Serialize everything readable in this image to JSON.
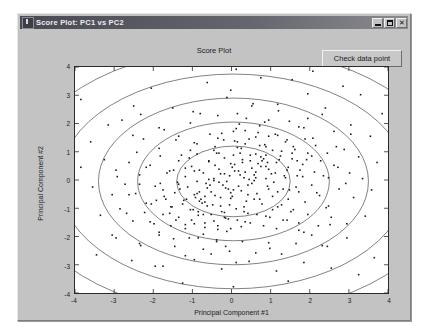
{
  "window": {
    "title": "Score Plot: PC1  vs  PC2",
    "app_icon": "matlab-figure-icon",
    "controls": {
      "minimize": "minimize-icon",
      "maximize": "maximize-icon",
      "close": "✕"
    }
  },
  "toolbar": {
    "check_data_point_label": "Check data point"
  },
  "colors": {
    "window_face": "#c3c3c3",
    "titlebar": "#66666e",
    "plot_background": "#ffffff",
    "axis_line": "#2b2b2b",
    "marker": "#1a1a1a",
    "contour": "#4a4a4a"
  },
  "chart_data": {
    "type": "scatter",
    "title": "Score Plot",
    "xlabel": "Principal Component  #1",
    "ylabel": "Principal Component  #2",
    "xlim": [
      -4,
      4
    ],
    "ylim": [
      -4,
      4
    ],
    "xticks": [
      -4,
      -3,
      -2,
      -1,
      0,
      1,
      2,
      3,
      4
    ],
    "yticks": [
      -4,
      -3,
      -2,
      -1,
      0,
      1,
      2,
      3,
      4
    ],
    "xtick_labels": [
      "-4",
      "-3",
      "-2",
      "-1",
      "0",
      "1",
      "2",
      "3",
      "4"
    ],
    "ytick_labels": [
      "-4",
      "-3",
      "-2",
      "-1",
      "0",
      "1",
      "2",
      "3",
      "4"
    ],
    "grid": false,
    "legend": null,
    "marker_style": "dot",
    "marker_size_px": 1.6,
    "n_points": 430,
    "distribution": {
      "kind": "bivariate-normal",
      "mean": [
        0.05,
        -0.05
      ],
      "sigma_x": 1.05,
      "sigma_y": 0.95,
      "correlation": 0.05
    },
    "contours": {
      "description": "concentric confidence ellipses centred on the data mean",
      "center": [
        0.05,
        -0.05
      ],
      "orientation_deg": 0,
      "radii": [
        {
          "rx": 1.45,
          "ry": 1.25
        },
        {
          "rx": 2.45,
          "ry": 2.1
        },
        {
          "rx": 3.45,
          "ry": 2.95
        },
        {
          "rx": 4.45,
          "ry": 3.8
        },
        {
          "rx": 5.5,
          "ry": 4.7
        }
      ]
    },
    "points": [
      [
        0.12,
        3.92
      ],
      [
        1.55,
        3.55
      ],
      [
        -0.02,
        3.18
      ],
      [
        2.85,
        3.32
      ],
      [
        3.3,
        3.02
      ],
      [
        -2.5,
        2.62
      ],
      [
        -1.5,
        2.55
      ],
      [
        -0.8,
        2.35
      ],
      [
        0.55,
        2.7
      ],
      [
        1.2,
        2.45
      ],
      [
        1.95,
        2.18
      ],
      [
        2.4,
        2.55
      ],
      [
        -3.15,
        1.95
      ],
      [
        -2.8,
        2.12
      ],
      [
        -1.05,
        2.02
      ],
      [
        -0.35,
        2.28
      ],
      [
        0.2,
        1.98
      ],
      [
        0.95,
        2.12
      ],
      [
        1.72,
        1.88
      ],
      [
        2.62,
        1.72
      ],
      [
        3.05,
        1.62
      ],
      [
        3.55,
        1.55
      ],
      [
        -3.6,
        1.35
      ],
      [
        -2.25,
        1.45
      ],
      [
        -1.85,
        1.12
      ],
      [
        -1.35,
        1.55
      ],
      [
        -0.95,
        1.32
      ],
      [
        -0.55,
        1.62
      ],
      [
        -0.2,
        1.42
      ],
      [
        0.05,
        1.72
      ],
      [
        0.35,
        1.28
      ],
      [
        0.62,
        1.52
      ],
      [
        0.88,
        1.18
      ],
      [
        1.12,
        1.62
      ],
      [
        1.38,
        1.35
      ],
      [
        1.62,
        1.08
      ],
      [
        1.88,
        1.45
      ],
      [
        2.15,
        1.22
      ],
      [
        2.45,
        0.95
      ],
      [
        2.88,
        1.08
      ],
      [
        3.25,
        0.82
      ],
      [
        3.72,
        0.62
      ],
      [
        -3.85,
        0.45
      ],
      [
        -3.25,
        0.72
      ],
      [
        -2.95,
        0.35
      ],
      [
        -2.62,
        0.62
      ],
      [
        -2.35,
        0.18
      ],
      [
        -2.08,
        0.52
      ],
      [
        -1.82,
        0.85
      ],
      [
        -1.58,
        0.32
      ],
      [
        -1.35,
        0.68
      ],
      [
        -1.18,
        0.12
      ],
      [
        -1.02,
        0.48
      ],
      [
        -0.88,
        0.92
      ],
      [
        -0.72,
        0.25
      ],
      [
        -0.58,
        0.65
      ],
      [
        -0.45,
        1.05
      ],
      [
        -0.32,
        0.38
      ],
      [
        -0.18,
        0.78
      ],
      [
        -0.05,
        0.15
      ],
      [
        0.08,
        0.55
      ],
      [
        0.22,
        0.95
      ],
      [
        0.35,
        0.28
      ],
      [
        0.48,
        0.68
      ],
      [
        0.62,
        0.08
      ],
      [
        0.75,
        0.48
      ],
      [
        0.88,
        0.88
      ],
      [
        1.02,
        0.22
      ],
      [
        1.15,
        0.62
      ],
      [
        1.28,
        1.02
      ],
      [
        1.42,
        0.35
      ],
      [
        1.55,
        0.75
      ],
      [
        1.68,
        0.15
      ],
      [
        1.82,
        0.55
      ],
      [
        1.95,
        0.95
      ],
      [
        2.12,
        0.28
      ],
      [
        2.28,
        0.68
      ],
      [
        2.48,
        0.08
      ],
      [
        2.72,
        0.45
      ],
      [
        3.02,
        0.25
      ],
      [
        3.35,
        0.05
      ],
      [
        -3.55,
        -0.25
      ],
      [
        -3.05,
        -0.52
      ],
      [
        -2.72,
        -0.15
      ],
      [
        -2.45,
        -0.48
      ],
      [
        -2.18,
        -0.82
      ],
      [
        -1.95,
        -0.22
      ],
      [
        -1.72,
        -0.58
      ],
      [
        -1.52,
        -0.95
      ],
      [
        -1.32,
        -0.32
      ],
      [
        -1.15,
        -0.68
      ],
      [
        -0.98,
        -1.05
      ],
      [
        -0.82,
        -0.42
      ],
      [
        -0.68,
        -0.78
      ],
      [
        -0.55,
        -0.18
      ],
      [
        -0.42,
        -0.55
      ],
      [
        -0.28,
        -0.92
      ],
      [
        -0.15,
        -0.28
      ],
      [
        -0.02,
        -0.65
      ],
      [
        0.12,
        -1.02
      ],
      [
        0.25,
        -0.38
      ],
      [
        0.38,
        -0.75
      ],
      [
        0.52,
        -0.12
      ],
      [
        0.65,
        -0.48
      ],
      [
        0.78,
        -0.85
      ],
      [
        0.92,
        -0.22
      ],
      [
        1.05,
        -0.58
      ],
      [
        1.18,
        -0.95
      ],
      [
        1.32,
        -0.32
      ],
      [
        1.45,
        -0.68
      ],
      [
        1.58,
        -1.05
      ],
      [
        1.72,
        -0.42
      ],
      [
        1.88,
        -0.78
      ],
      [
        2.05,
        -0.18
      ],
      [
        2.25,
        -0.55
      ],
      [
        2.48,
        -0.92
      ],
      [
        2.75,
        -0.32
      ],
      [
        3.12,
        -0.62
      ],
      [
        3.58,
        -0.35
      ],
      [
        -3.35,
        -1.25
      ],
      [
        -2.85,
        -1.02
      ],
      [
        -2.52,
        -1.45
      ],
      [
        -2.22,
        -1.15
      ],
      [
        -1.98,
        -1.55
      ],
      [
        -1.75,
        -1.22
      ],
      [
        -1.55,
        -1.62
      ],
      [
        -1.35,
        -1.32
      ],
      [
        -1.18,
        -1.72
      ],
      [
        -1.02,
        -1.42
      ],
      [
        -0.85,
        -1.12
      ],
      [
        -0.68,
        -1.52
      ],
      [
        -0.52,
        -1.22
      ],
      [
        -0.35,
        -1.62
      ],
      [
        -0.18,
        -1.32
      ],
      [
        -0.02,
        -1.72
      ],
      [
        0.15,
        -1.42
      ],
      [
        0.32,
        -1.12
      ],
      [
        0.48,
        -1.52
      ],
      [
        0.65,
        -1.22
      ],
      [
        0.82,
        -1.62
      ],
      [
        0.98,
        -1.32
      ],
      [
        1.15,
        -1.72
      ],
      [
        1.32,
        -1.42
      ],
      [
        1.52,
        -1.12
      ],
      [
        1.72,
        -1.52
      ],
      [
        1.95,
        -1.22
      ],
      [
        2.22,
        -1.62
      ],
      [
        2.55,
        -1.32
      ],
      [
        2.95,
        -1.55
      ],
      [
        3.42,
        -1.28
      ],
      [
        -2.95,
        -2.05
      ],
      [
        -2.35,
        -2.25
      ],
      [
        -1.85,
        -1.95
      ],
      [
        -1.45,
        -2.35
      ],
      [
        -1.08,
        -2.05
      ],
      [
        -0.72,
        -2.45
      ],
      [
        -0.38,
        -2.12
      ],
      [
        -0.05,
        -2.52
      ],
      [
        0.28,
        -2.18
      ],
      [
        0.62,
        -2.58
      ],
      [
        0.95,
        -2.22
      ],
      [
        1.28,
        -2.62
      ],
      [
        1.65,
        -2.25
      ],
      [
        2.05,
        -1.95
      ],
      [
        2.45,
        -2.35
      ],
      [
        2.95,
        -2.05
      ],
      [
        -2.55,
        -2.85
      ],
      [
        -1.75,
        -3.05
      ],
      [
        -0.95,
        -2.82
      ],
      [
        -0.25,
        -3.15
      ],
      [
        0.45,
        -2.88
      ],
      [
        1.15,
        -3.22
      ],
      [
        1.85,
        -2.92
      ],
      [
        2.55,
        -3.12
      ],
      [
        -1.25,
        -3.65
      ],
      [
        0.05,
        -3.78
      ],
      [
        1.45,
        -3.58
      ],
      [
        3.25,
        -3.35
      ],
      [
        -3.85,
        2.85
      ],
      [
        3.85,
        2.35
      ],
      [
        -0.62,
        3.45
      ],
      [
        2.08,
        3.85
      ],
      [
        -3.45,
        -2.65
      ],
      [
        3.65,
        -2.75
      ],
      [
        0.75,
        3.62
      ],
      [
        -2.05,
        3.25
      ],
      [
        -0.45,
        0.05
      ],
      [
        0.18,
        0.32
      ],
      [
        -0.12,
        -0.05
      ],
      [
        0.42,
        -0.18
      ],
      [
        -0.28,
        0.22
      ],
      [
        0.05,
        -0.35
      ],
      [
        0.58,
        0.18
      ],
      [
        -0.65,
        -0.12
      ],
      [
        0.28,
        0.72
      ],
      [
        -0.38,
        0.95
      ],
      [
        0.72,
        -0.68
      ],
      [
        -0.82,
        0.35
      ],
      [
        0.95,
        0.38
      ],
      [
        -0.95,
        -0.52
      ],
      [
        1.08,
        -0.08
      ],
      [
        -1.08,
        0.78
      ],
      [
        0.15,
        1.15
      ],
      [
        -0.18,
        -1.15
      ],
      [
        1.25,
        0.85
      ],
      [
        -1.25,
        -0.85
      ],
      [
        0.85,
        1.25
      ],
      [
        -0.85,
        -1.25
      ],
      [
        1.45,
        0.45
      ],
      [
        -1.45,
        -0.45
      ],
      [
        0.45,
        1.45
      ],
      [
        -0.45,
        -1.45
      ],
      [
        1.65,
        -0.25
      ],
      [
        -1.65,
        0.25
      ],
      [
        0.25,
        -1.65
      ],
      [
        -0.25,
        1.65
      ],
      [
        1.92,
        0.72
      ],
      [
        -1.92,
        -0.72
      ],
      [
        0.72,
        1.92
      ],
      [
        -0.72,
        -1.92
      ],
      [
        2.18,
        -0.45
      ],
      [
        -2.18,
        0.45
      ],
      [
        0.38,
        2.18
      ],
      [
        -0.38,
        -2.18
      ],
      [
        0.52,
        0.42
      ],
      [
        -0.52,
        -0.42
      ],
      [
        0.42,
        -0.52
      ],
      [
        -0.42,
        0.52
      ],
      [
        0.68,
        0.58
      ],
      [
        -0.68,
        -0.58
      ],
      [
        0.58,
        -0.68
      ],
      [
        -0.58,
        0.68
      ],
      [
        0.88,
        0.05
      ],
      [
        -0.88,
        -0.05
      ],
      [
        0.05,
        0.88
      ],
      [
        -0.05,
        -0.88
      ],
      [
        1.12,
        0.25
      ],
      [
        -1.12,
        -0.25
      ],
      [
        0.25,
        1.12
      ],
      [
        -0.25,
        -1.12
      ],
      [
        0.32,
        0.08
      ],
      [
        -0.32,
        -0.08
      ],
      [
        0.08,
        0.32
      ],
      [
        -0.08,
        -0.32
      ],
      [
        0.62,
        0.28
      ],
      [
        -0.62,
        -0.28
      ],
      [
        0.28,
        0.62
      ],
      [
        -0.28,
        -0.62
      ],
      [
        1.35,
        0.15
      ],
      [
        -1.35,
        -0.15
      ],
      [
        0.15,
        1.35
      ],
      [
        -0.15,
        -1.35
      ],
      [
        0.78,
        0.68
      ],
      [
        -0.78,
        -0.68
      ],
      [
        1.55,
        0.95
      ],
      [
        -1.55,
        -0.95
      ],
      [
        0.95,
        1.55
      ],
      [
        -0.95,
        -1.55
      ],
      [
        1.75,
        0.35
      ],
      [
        -1.75,
        -0.35
      ],
      [
        0.35,
        1.75
      ],
      [
        -0.35,
        -1.75
      ],
      [
        2.05,
        0.85
      ],
      [
        -2.05,
        -0.85
      ],
      [
        0.85,
        2.05
      ],
      [
        -0.85,
        -2.05
      ],
      [
        2.35,
        0.15
      ],
      [
        -2.35,
        -0.15
      ],
      [
        0.15,
        2.35
      ],
      [
        -0.15,
        -2.35
      ],
      [
        0.48,
        0.88
      ],
      [
        -0.48,
        -0.88
      ],
      [
        0.88,
        0.48
      ],
      [
        -0.88,
        -0.48
      ],
      [
        1.22,
        0.72
      ],
      [
        -1.22,
        -0.72
      ],
      [
        0.72,
        1.22
      ],
      [
        -0.72,
        -1.22
      ],
      [
        1.48,
        -0.35
      ],
      [
        -1.48,
        0.35
      ],
      [
        -0.35,
        1.48
      ],
      [
        0.35,
        -1.48
      ],
      [
        1.82,
        0.12
      ],
      [
        -1.82,
        -0.12
      ],
      [
        0.12,
        1.82
      ],
      [
        -0.12,
        -1.82
      ],
      [
        2.62,
        0.52
      ],
      [
        -2.62,
        -0.52
      ],
      [
        0.52,
        2.62
      ],
      [
        -0.52,
        -2.62
      ],
      [
        2.92,
        -0.12
      ],
      [
        -2.92,
        0.12
      ],
      [
        -0.12,
        2.92
      ],
      [
        0.12,
        -2.92
      ],
      [
        1.05,
        1.05
      ],
      [
        -1.05,
        -1.05
      ],
      [
        1.05,
        -1.05
      ],
      [
        -1.05,
        1.05
      ],
      [
        1.42,
        1.42
      ],
      [
        -1.42,
        -1.42
      ],
      [
        1.42,
        -1.42
      ],
      [
        -1.42,
        1.42
      ],
      [
        1.85,
        1.85
      ],
      [
        -1.85,
        -1.85
      ],
      [
        1.85,
        -1.85
      ],
      [
        -1.85,
        1.85
      ],
      [
        2.32,
        2.32
      ],
      [
        -2.32,
        -2.32
      ],
      [
        2.32,
        -2.32
      ],
      [
        -2.32,
        2.32
      ],
      [
        0.68,
        1.68
      ],
      [
        -0.68,
        -1.68
      ],
      [
        1.68,
        0.68
      ],
      [
        -1.68,
        -0.68
      ],
      [
        0.22,
        0.18
      ],
      [
        -0.22,
        -0.18
      ],
      [
        0.18,
        -0.22
      ],
      [
        -0.18,
        0.22
      ],
      [
        0.95,
        -0.32
      ],
      [
        -0.95,
        0.32
      ],
      [
        -0.32,
        0.95
      ],
      [
        0.32,
        -0.95
      ],
      [
        1.28,
        -0.88
      ],
      [
        -1.28,
        0.88
      ],
      [
        -0.88,
        1.28
      ],
      [
        0.88,
        -1.28
      ],
      [
        0.45,
        0.02
      ],
      [
        -0.45,
        -0.02
      ],
      [
        0.02,
        0.45
      ],
      [
        -0.02,
        -0.45
      ],
      [
        0.75,
        0.82
      ],
      [
        -0.75,
        -0.82
      ],
      [
        0.82,
        0.75
      ],
      [
        -0.82,
        -0.75
      ],
      [
        1.18,
        -0.42
      ],
      [
        -1.18,
        0.42
      ],
      [
        -0.42,
        1.18
      ],
      [
        0.42,
        -1.18
      ],
      [
        1.58,
        1.18
      ],
      [
        -1.58,
        -1.18
      ],
      [
        1.18,
        1.58
      ],
      [
        -1.18,
        -1.58
      ],
      [
        2.08,
        1.48
      ],
      [
        -2.08,
        -1.48
      ],
      [
        1.48,
        2.08
      ],
      [
        -1.48,
        -2.08
      ],
      [
        2.68,
        1.18
      ],
      [
        -2.68,
        -1.18
      ],
      [
        1.18,
        2.68
      ],
      [
        -1.18,
        -2.68
      ],
      [
        0.58,
        -0.02
      ],
      [
        -0.58,
        0.02
      ],
      [
        -0.02,
        0.58
      ],
      [
        0.02,
        -0.58
      ],
      [
        1.72,
        -1.78
      ],
      [
        -1.72,
        1.78
      ],
      [
        2.52,
        -1.58
      ],
      [
        -2.52,
        1.58
      ],
      [
        0.98,
        -2.42
      ],
      [
        -0.98,
        2.42
      ],
      [
        -2.42,
        0.98
      ],
      [
        2.42,
        -0.98
      ],
      [
        3.05,
        1.95
      ],
      [
        -3.05,
        -1.95
      ],
      [
        1.95,
        3.05
      ],
      [
        -1.95,
        -3.05
      ],
      [
        0.62,
        0.92
      ],
      [
        -0.62,
        -0.92
      ],
      [
        0.92,
        0.62
      ],
      [
        -0.92,
        -0.62
      ],
      [
        1.38,
        0.08
      ],
      [
        -1.38,
        -0.08
      ],
      [
        0.08,
        1.38
      ],
      [
        -0.08,
        -1.38
      ]
    ]
  }
}
